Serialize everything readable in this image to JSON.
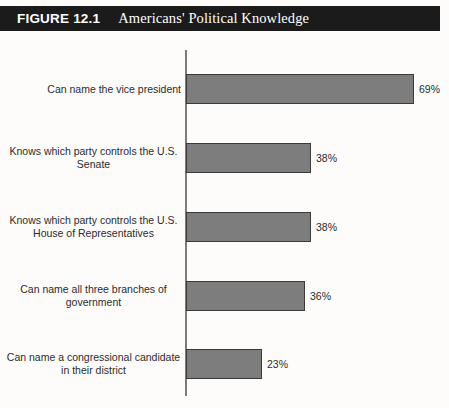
{
  "header": {
    "figure_number": "FIGURE 12.1",
    "title": "Americans' Political Knowledge",
    "banner_color": "#1b1b1b",
    "text_color": "#ffffff"
  },
  "colors": {
    "background": "#fdfcfb",
    "bar_fill": "#7d7d7d",
    "bar_border": "#3a3a3a",
    "axis": "#7b7b7b",
    "label_text": "#2b2b2b"
  },
  "chart_data": {
    "type": "bar",
    "orientation": "horizontal",
    "title": "Americans' Political Knowledge",
    "xlabel": "",
    "ylabel": "",
    "xlim": [
      0,
      100
    ],
    "grid": false,
    "legend": null,
    "value_suffix": "%",
    "categories": [
      "Can name the vice president",
      "Knows which party controls the U.S.\nSenate",
      "Knows which party controls the U.S.\nHouse of Representatives",
      "Can name all three branches of\ngovernment",
      "Can name a congressional candidate\nin their district"
    ],
    "values": [
      69,
      38,
      38,
      36,
      23
    ],
    "value_labels": [
      "69%",
      "38%",
      "38%",
      "36%",
      "23%"
    ]
  },
  "bars": [
    {
      "label": "Can name the vice president",
      "lines": 1,
      "value": 69,
      "value_label": "69%"
    },
    {
      "label": "Knows which party controls the U.S.\nSenate",
      "lines": 2,
      "value": 38,
      "value_label": "38%"
    },
    {
      "label": "Knows which party controls the U.S.\nHouse of Representatives",
      "lines": 2,
      "value": 38,
      "value_label": "38%"
    },
    {
      "label": "Can name all three branches of\ngovernment",
      "lines": 2,
      "value": 36,
      "value_label": "36%"
    },
    {
      "label": "Can name a congressional candidate\nin their district",
      "lines": 2,
      "value": 23,
      "value_label": "23%"
    }
  ],
  "layout": {
    "row_tops": [
      42,
      111,
      180,
      249,
      317
    ],
    "px_per_percent": 3.3
  }
}
